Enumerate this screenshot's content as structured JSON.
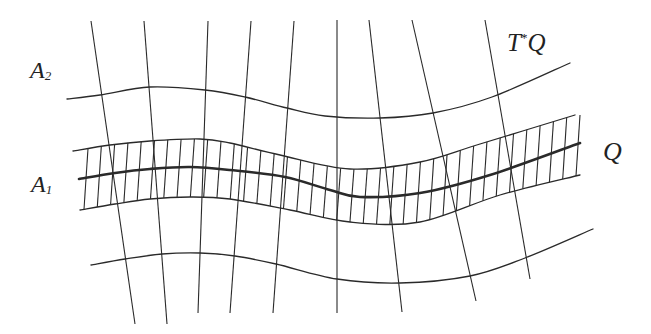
{
  "diagram": {
    "stroke_color": "#2a2a2a",
    "background": "#ffffff",
    "labels": {
      "a2": {
        "main": "A",
        "sub": "2"
      },
      "a1": {
        "main": "A",
        "sub": "1"
      },
      "tq": {
        "pre": "T",
        "sup": "*",
        "post": "Q"
      },
      "q": {
        "main": "Q"
      }
    },
    "curves": {
      "a2_top": {
        "name": "curve-a2",
        "width": 1.3,
        "points": [
          [
            67,
            99
          ],
          [
            100,
            95
          ],
          [
            150,
            87
          ],
          [
            205,
            90
          ],
          [
            245,
            97
          ],
          [
            287,
            108
          ],
          [
            325,
            116
          ],
          [
            380,
            118
          ],
          [
            433,
            113
          ],
          [
            492,
            97
          ],
          [
            570,
            63
          ]
        ]
      },
      "band_upper": {
        "name": "band-upper-edge",
        "width": 1.3,
        "points": [
          [
            73,
            151
          ],
          [
            110,
            145
          ],
          [
            150,
            141
          ],
          [
            200,
            139
          ],
          [
            230,
            143
          ],
          [
            280,
            155
          ],
          [
            350,
            169
          ],
          [
            420,
            162
          ],
          [
            480,
            144
          ],
          [
            575,
            115
          ]
        ]
      },
      "q_base": {
        "name": "curve-q-base",
        "width": 2.6,
        "points": [
          [
            79,
            179
          ],
          [
            115,
            173
          ],
          [
            150,
            169
          ],
          [
            190,
            167
          ],
          [
            230,
            170
          ],
          [
            285,
            177
          ],
          [
            330,
            190
          ],
          [
            360,
            197
          ],
          [
            420,
            193
          ],
          [
            490,
            175
          ],
          [
            580,
            143
          ]
        ]
      },
      "band_lower": {
        "name": "band-lower-edge",
        "width": 1.3,
        "points": [
          [
            80,
            210
          ],
          [
            115,
            204
          ],
          [
            150,
            199
          ],
          [
            190,
            197
          ],
          [
            230,
            199
          ],
          [
            290,
            210
          ],
          [
            350,
            222
          ],
          [
            420,
            222
          ],
          [
            500,
            195
          ],
          [
            580,
            175
          ]
        ]
      },
      "a_bottom": {
        "name": "curve-bottom",
        "width": 1.3,
        "points": [
          [
            91,
            265
          ],
          [
            125,
            259
          ],
          [
            162,
            254
          ],
          [
            200,
            253
          ],
          [
            235,
            256
          ],
          [
            276,
            264
          ],
          [
            337,
            279
          ],
          [
            400,
            283
          ],
          [
            470,
            276
          ],
          [
            525,
            258
          ],
          [
            593,
            229
          ]
        ]
      }
    },
    "fibers": [
      {
        "top": [
          91,
          21
        ],
        "bottom": [
          135,
          324
        ]
      },
      {
        "top": [
          144,
          21
        ],
        "bottom": [
          167,
          324
        ]
      },
      {
        "top": [
          208,
          21
        ],
        "bottom": [
          198,
          313
        ]
      },
      {
        "top": [
          251,
          21
        ],
        "bottom": [
          230,
          313
        ]
      },
      {
        "top": [
          294,
          21
        ],
        "bottom": [
          273,
          313
        ]
      },
      {
        "top": [
          337,
          20
        ],
        "bottom": [
          337,
          313
        ]
      },
      {
        "top": [
          369,
          20
        ],
        "bottom": [
          402,
          312
        ]
      },
      {
        "top": [
          412,
          20
        ],
        "bottom": [
          476,
          301
        ]
      },
      {
        "top": [
          485,
          20
        ],
        "bottom": [
          530,
          279
        ]
      }
    ],
    "hatch": {
      "x_start": 84,
      "x_end": 576,
      "count": 38,
      "lean": 4,
      "width": 1.1
    }
  }
}
